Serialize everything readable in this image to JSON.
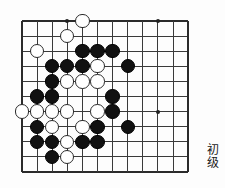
{
  "page": {
    "kind": "go-board-diagram",
    "background_color": "#fdfdfd"
  },
  "board": {
    "line_color": "#3a3a3a",
    "edge_color": "#2b2b2b",
    "origin_x": 22,
    "origin_y": 21,
    "spacing": 15.1,
    "cols": 12,
    "rows": 11,
    "stone_radius": 7.2,
    "black_color": "#111111",
    "white_color": "#ffffff",
    "star_points": [
      {
        "col": 3,
        "row": 0
      },
      {
        "col": 9,
        "row": 0
      },
      {
        "col": 9,
        "row": 6
      }
    ],
    "stones": [
      {
        "color": "white",
        "col": 4,
        "row": 0
      },
      {
        "color": "white",
        "col": 3,
        "row": 1
      },
      {
        "color": "white",
        "col": 1,
        "row": 2
      },
      {
        "color": "black",
        "col": 4,
        "row": 2
      },
      {
        "color": "black",
        "col": 5,
        "row": 2
      },
      {
        "color": "black",
        "col": 6,
        "row": 2
      },
      {
        "color": "black",
        "col": 2,
        "row": 3
      },
      {
        "color": "black",
        "col": 3,
        "row": 3
      },
      {
        "color": "black",
        "col": 4,
        "row": 3
      },
      {
        "color": "white",
        "col": 5,
        "row": 3
      },
      {
        "color": "black",
        "col": 7,
        "row": 3
      },
      {
        "color": "black",
        "col": 2,
        "row": 4
      },
      {
        "color": "white",
        "col": 3,
        "row": 4
      },
      {
        "color": "white",
        "col": 4,
        "row": 4
      },
      {
        "color": "white",
        "col": 5,
        "row": 4
      },
      {
        "color": "black",
        "col": 1,
        "row": 5
      },
      {
        "color": "black",
        "col": 2,
        "row": 5
      },
      {
        "color": "black",
        "col": 6,
        "row": 5
      },
      {
        "color": "white",
        "col": 0,
        "row": 6
      },
      {
        "color": "white",
        "col": 1,
        "row": 6
      },
      {
        "color": "white",
        "col": 2,
        "row": 6
      },
      {
        "color": "white",
        "col": 3,
        "row": 6
      },
      {
        "color": "white",
        "col": 5,
        "row": 6
      },
      {
        "color": "black",
        "col": 6,
        "row": 6
      },
      {
        "color": "black",
        "col": 1,
        "row": 7
      },
      {
        "color": "white",
        "col": 2,
        "row": 7
      },
      {
        "color": "white",
        "col": 4,
        "row": 7
      },
      {
        "color": "black",
        "col": 5,
        "row": 7
      },
      {
        "color": "black",
        "col": 7,
        "row": 7
      },
      {
        "color": "black",
        "col": 1,
        "row": 8
      },
      {
        "color": "black",
        "col": 2,
        "row": 8
      },
      {
        "color": "white",
        "col": 3,
        "row": 8
      },
      {
        "color": "black",
        "col": 4,
        "row": 8
      },
      {
        "color": "black",
        "col": 5,
        "row": 8
      },
      {
        "color": "black",
        "col": 2,
        "row": 9
      },
      {
        "color": "white",
        "col": 3,
        "row": 9
      }
    ]
  },
  "level_label": {
    "name": "difficulty-level",
    "char_1": "初",
    "char_2": "级",
    "text": "初级"
  }
}
